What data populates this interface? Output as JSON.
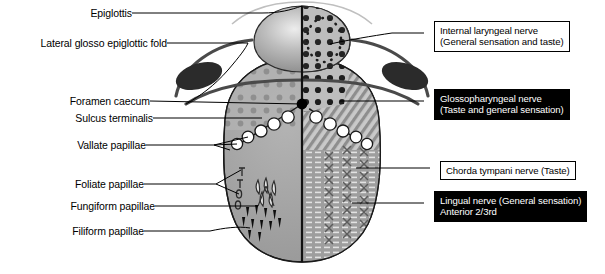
{
  "figure": {
    "midline_label": "median sulcus"
  },
  "left_labels": [
    {
      "id": "epiglottis",
      "text": "Epiglottis"
    },
    {
      "id": "lateral-fold",
      "text": "Lateral glosso epiglottic fold"
    },
    {
      "id": "foramen-caecum",
      "text": "Foramen caecum"
    },
    {
      "id": "sulcus-terminalis",
      "text": "Sulcus terminalis"
    },
    {
      "id": "vallate",
      "text": "Vallate papillae"
    },
    {
      "id": "foliate",
      "text": "Foliate papillae"
    },
    {
      "id": "fungiform",
      "text": "Fungiform papillae"
    },
    {
      "id": "filiform",
      "text": "Filiform papillae"
    }
  ],
  "right_boxes": [
    {
      "id": "internal-laryngeal",
      "style": "white",
      "line1": "Internal laryngeal nerve",
      "line2": "(General sensation and taste)"
    },
    {
      "id": "glossopharyngeal",
      "style": "black",
      "line1": "Glossopharyngeal nerve",
      "line2": "(Taste and general sensation)"
    },
    {
      "id": "chorda-tympani",
      "style": "white",
      "line1": "Chorda tympani nerve (Taste)",
      "line2": ""
    },
    {
      "id": "lingual",
      "style": "black",
      "line1": "Lingual nerve (General sensation)",
      "line2": "Anterior 2/3rd"
    }
  ],
  "colors": {
    "tongue_body": "#9e9e9e",
    "tongue_posterior": "#b0b0b0",
    "epiglottis": "#9a9a9a",
    "epiglottis_highlight": "#e8e8e8",
    "tonsil_dot": "#858585",
    "outline": "#1a1a1a",
    "dark_ellipse": "#2b2b2b",
    "hatch": "#8a8a8a",
    "papilla_fill": "#ffffff",
    "box_white_bg": "#ffffff",
    "box_black_bg": "#000000",
    "leader": "#000000"
  },
  "anatomy": {
    "vallate_papillae_left_count": 6,
    "vallate_papillae_right_count": 6,
    "foliate_ridges_count": 4,
    "fungiform_count": 5,
    "filiform_count": 11,
    "regions": [
      {
        "name": "internal-laryngeal-territory",
        "pattern": "coarse-dots",
        "side": "right-posterior-epiglottic"
      },
      {
        "name": "glossopharyngeal-territory",
        "pattern": "diagonal-hatch",
        "side": "right-posterior"
      },
      {
        "name": "chorda-tympani-territory",
        "pattern": "x-columns",
        "side": "right-anterior"
      },
      {
        "name": "lingual-territory",
        "pattern": "horizontal-dashes",
        "side": "right-anterior"
      },
      {
        "name": "lingual-tonsil",
        "pattern": "soft-dots",
        "side": "left-posterior"
      }
    ]
  }
}
